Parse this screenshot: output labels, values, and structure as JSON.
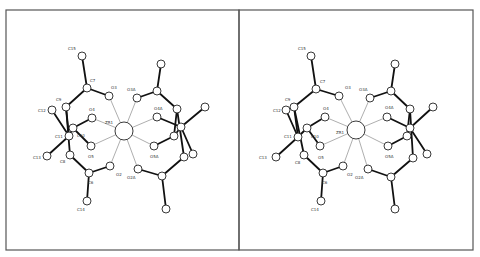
{
  "figure": {
    "type": "stereo-pair",
    "panels": [
      {
        "name": "left-view",
        "frame": {
          "x": 6,
          "y": 10,
          "w": 233,
          "h": 240
        },
        "atoms": [
          {
            "id": "Zr1",
            "label": "ZR1",
            "x": 124,
            "y": 131,
            "r": 9,
            "lx": 105,
            "ly": 124
          },
          {
            "id": "C15",
            "label": "C15",
            "x": 82,
            "y": 56,
            "r": 4,
            "lx": 68,
            "ly": 50
          },
          {
            "id": "C7",
            "label": "C7",
            "x": 87,
            "y": 88,
            "r": 4,
            "lx": 90,
            "ly": 82
          },
          {
            "id": "O3",
            "label": "O3",
            "x": 109,
            "y": 96,
            "r": 4,
            "lx": 111,
            "ly": 89
          },
          {
            "id": "C9",
            "label": "C9",
            "x": 66,
            "y": 107,
            "r": 4,
            "lx": 56,
            "ly": 101
          },
          {
            "id": "C12",
            "label": "C12",
            "x": 52,
            "y": 110,
            "r": 4,
            "lx": 38,
            "ly": 112
          },
          {
            "id": "O4",
            "label": "O4",
            "x": 92,
            "y": 118,
            "r": 4,
            "lx": 89,
            "ly": 111
          },
          {
            "id": "C10",
            "label": "C10",
            "x": 73,
            "y": 128,
            "r": 4,
            "lx": 77,
            "ly": 137
          },
          {
            "id": "C11",
            "label": "C11",
            "x": 69,
            "y": 136,
            "r": 4,
            "lx": 55,
            "ly": 138
          },
          {
            "id": "O5",
            "label": "O5",
            "x": 91,
            "y": 146,
            "r": 4,
            "lx": 88,
            "ly": 158
          },
          {
            "id": "C13",
            "label": "C13",
            "x": 47,
            "y": 156,
            "r": 4,
            "lx": 33,
            "ly": 159
          },
          {
            "id": "C8",
            "label": "C8",
            "x": 70,
            "y": 155,
            "r": 4,
            "lx": 60,
            "ly": 163
          },
          {
            "id": "C6",
            "label": "C6",
            "x": 89,
            "y": 173,
            "r": 4,
            "lx": 88,
            "ly": 184
          },
          {
            "id": "O2",
            "label": "O2",
            "x": 110,
            "y": 166,
            "r": 4,
            "lx": 116,
            "ly": 176
          },
          {
            "id": "C14",
            "label": "C14",
            "x": 87,
            "y": 201,
            "r": 4,
            "lx": 77,
            "ly": 211
          },
          {
            "id": "O3A",
            "label": "O3A",
            "x": 137,
            "y": 98,
            "r": 4,
            "lx": 127,
            "ly": 91
          },
          {
            "id": "O4A",
            "label": "O4A",
            "x": 157,
            "y": 117,
            "r": 4,
            "lx": 154,
            "ly": 110
          },
          {
            "id": "O5A",
            "label": "O5A",
            "x": 154,
            "y": 146,
            "r": 4,
            "lx": 150,
            "ly": 158
          },
          {
            "id": "O2A",
            "label": "O2A",
            "x": 138,
            "y": 169,
            "r": 4,
            "lx": 127,
            "ly": 179
          },
          {
            "id": "C15A",
            "label": "",
            "x": 161,
            "y": 64,
            "r": 4
          },
          {
            "id": "C7A",
            "label": "",
            "x": 157,
            "y": 91,
            "r": 4
          },
          {
            "id": "C9A",
            "label": "",
            "x": 177,
            "y": 109,
            "r": 4
          },
          {
            "id": "C12A",
            "label": "",
            "x": 205,
            "y": 107,
            "r": 4
          },
          {
            "id": "C11A",
            "label": "",
            "x": 181,
            "y": 127,
            "r": 4
          },
          {
            "id": "C10A",
            "label": "",
            "x": 174,
            "y": 136,
            "r": 4
          },
          {
            "id": "C13A",
            "label": "",
            "x": 193,
            "y": 154,
            "r": 4
          },
          {
            "id": "C8A",
            "label": "",
            "x": 184,
            "y": 157,
            "r": 4
          },
          {
            "id": "C6A",
            "label": "",
            "x": 162,
            "y": 176,
            "r": 4
          },
          {
            "id": "C14A",
            "label": "",
            "x": 166,
            "y": 209,
            "r": 4
          }
        ]
      },
      {
        "name": "right-view",
        "frame": {
          "x": 239,
          "y": 10,
          "w": 234,
          "h": 240
        },
        "atoms": [
          {
            "id": "Zr1",
            "label": "ZR1",
            "x": 356,
            "y": 130,
            "r": 9,
            "lx": 336,
            "ly": 134
          },
          {
            "id": "C15",
            "label": "C15",
            "x": 311,
            "y": 56,
            "r": 4,
            "lx": 298,
            "ly": 50
          },
          {
            "id": "C7",
            "label": "C7",
            "x": 316,
            "y": 89,
            "r": 4,
            "lx": 320,
            "ly": 83
          },
          {
            "id": "O3",
            "label": "O3",
            "x": 339,
            "y": 96,
            "r": 4,
            "lx": 345,
            "ly": 89
          },
          {
            "id": "C9",
            "label": "C9",
            "x": 294,
            "y": 107,
            "r": 4,
            "lx": 285,
            "ly": 101
          },
          {
            "id": "C12",
            "label": "C12",
            "x": 286,
            "y": 110,
            "r": 4,
            "lx": 273,
            "ly": 112
          },
          {
            "id": "O4",
            "label": "O4",
            "x": 325,
            "y": 117,
            "r": 4,
            "lx": 323,
            "ly": 110
          },
          {
            "id": "C10",
            "label": "C10",
            "x": 307,
            "y": 128,
            "r": 4,
            "lx": 311,
            "ly": 138
          },
          {
            "id": "C11",
            "label": "C11",
            "x": 298,
            "y": 137,
            "r": 4,
            "lx": 284,
            "ly": 138
          },
          {
            "id": "O5",
            "label": "O5",
            "x": 320,
            "y": 146,
            "r": 4,
            "lx": 318,
            "ly": 159
          },
          {
            "id": "C13",
            "label": "C13",
            "x": 276,
            "y": 157,
            "r": 4,
            "lx": 259,
            "ly": 159
          },
          {
            "id": "C8",
            "label": "C8",
            "x": 304,
            "y": 155,
            "r": 4,
            "lx": 295,
            "ly": 164
          },
          {
            "id": "C6",
            "label": "C6",
            "x": 323,
            "y": 173,
            "r": 4,
            "lx": 322,
            "ly": 184
          },
          {
            "id": "O2",
            "label": "O2",
            "x": 343,
            "y": 166,
            "r": 4,
            "lx": 347,
            "ly": 176
          },
          {
            "id": "C14",
            "label": "C14",
            "x": 321,
            "y": 201,
            "r": 4,
            "lx": 311,
            "ly": 211
          },
          {
            "id": "O3A",
            "label": "O3A",
            "x": 370,
            "y": 98,
            "r": 4,
            "lx": 359,
            "ly": 91
          },
          {
            "id": "O4A",
            "label": "O4A",
            "x": 387,
            "y": 117,
            "r": 4,
            "lx": 385,
            "ly": 109
          },
          {
            "id": "O5A",
            "label": "O5A",
            "x": 388,
            "y": 146,
            "r": 4,
            "lx": 385,
            "ly": 158
          },
          {
            "id": "O2A",
            "label": "O2A",
            "x": 368,
            "y": 169,
            "r": 4,
            "lx": 355,
            "ly": 179
          },
          {
            "id": "C15A",
            "label": "",
            "x": 395,
            "y": 64,
            "r": 4
          },
          {
            "id": "C7A",
            "label": "",
            "x": 391,
            "y": 91,
            "r": 4
          },
          {
            "id": "C9A",
            "label": "",
            "x": 410,
            "y": 109,
            "r": 4
          },
          {
            "id": "C12A",
            "label": "",
            "x": 433,
            "y": 107,
            "r": 4
          },
          {
            "id": "C11A",
            "label": "",
            "x": 410,
            "y": 128,
            "r": 4
          },
          {
            "id": "C10A",
            "label": "",
            "x": 407,
            "y": 136,
            "r": 4
          },
          {
            "id": "C13A",
            "label": "",
            "x": 427,
            "y": 154,
            "r": 4
          },
          {
            "id": "C8A",
            "label": "",
            "x": 413,
            "y": 158,
            "r": 4
          },
          {
            "id": "C6A",
            "label": "",
            "x": 391,
            "y": 177,
            "r": 4
          },
          {
            "id": "C14A",
            "label": "",
            "x": 395,
            "y": 209,
            "r": 4
          }
        ]
      }
    ],
    "bonds": [
      [
        "C15",
        "C7",
        "thick"
      ],
      [
        "C7",
        "O3",
        "thick"
      ],
      [
        "C7",
        "C9",
        "thick"
      ],
      [
        "C9",
        "C11",
        "thick"
      ],
      [
        "C11",
        "C12",
        "thick"
      ],
      [
        "C11",
        "C13",
        "thick"
      ],
      [
        "C11",
        "C10",
        "thick"
      ],
      [
        "C10",
        "O4",
        "thick"
      ],
      [
        "C10",
        "O5",
        "thick"
      ],
      [
        "C9",
        "C8",
        "thick"
      ],
      [
        "C8",
        "C6",
        "thick"
      ],
      [
        "C6",
        "O2",
        "thick"
      ],
      [
        "C6",
        "C14",
        "thick"
      ],
      [
        "C15A",
        "C7A",
        "thick"
      ],
      [
        "C7A",
        "O3A",
        "thick"
      ],
      [
        "C7A",
        "C9A",
        "thick"
      ],
      [
        "C9A",
        "C10A",
        "thick"
      ],
      [
        "C11A",
        "C12A",
        "thick"
      ],
      [
        "C11A",
        "C13A",
        "thick"
      ],
      [
        "C11A",
        "O4A",
        "thick"
      ],
      [
        "C10A",
        "O5A",
        "thick"
      ],
      [
        "C9A",
        "C8A",
        "thick"
      ],
      [
        "C11A",
        "C10A",
        "thick"
      ],
      [
        "C8A",
        "C6A",
        "thick"
      ],
      [
        "C6A",
        "O2A",
        "thick"
      ],
      [
        "C6A",
        "C14A",
        "thick"
      ],
      [
        "Zr1",
        "O2",
        "thin"
      ],
      [
        "Zr1",
        "O3",
        "thin"
      ],
      [
        "Zr1",
        "O4",
        "thin"
      ],
      [
        "Zr1",
        "O5",
        "thin"
      ],
      [
        "Zr1",
        "O2A",
        "thin"
      ],
      [
        "Zr1",
        "O3A",
        "thin"
      ],
      [
        "Zr1",
        "O4A",
        "thin"
      ],
      [
        "Zr1",
        "O5A",
        "thin"
      ]
    ],
    "colors": {
      "border": "#555555",
      "bond": "#111111",
      "thin_bond": "#777777",
      "atom_fill": "#ffffff",
      "atom_stroke": "#222222"
    }
  }
}
